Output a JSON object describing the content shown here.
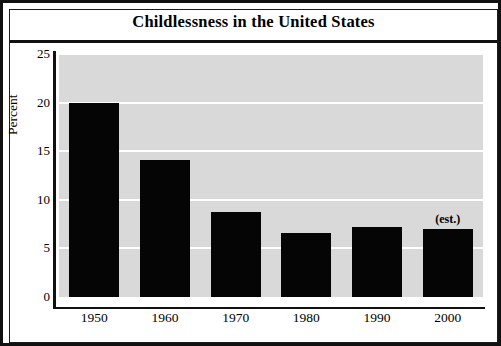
{
  "figure": {
    "title": "Childlessness in the United States"
  },
  "chart_data": {
    "type": "bar",
    "title": "Childlessness in the United States",
    "xlabel": "",
    "ylabel": "Percent",
    "categories": [
      "1950",
      "1960",
      "1970",
      "1980",
      "1990",
      "2000"
    ],
    "values": [
      20.0,
      14.1,
      8.7,
      6.6,
      7.2,
      7.0
    ],
    "ylim": [
      0,
      25
    ],
    "yticks": [
      "0",
      "5",
      "10",
      "15",
      "20",
      "25"
    ],
    "ytick_values": [
      0,
      5,
      10,
      15,
      20,
      25
    ],
    "grid": "horizontal-white-gridlines",
    "legend": "none",
    "bar_color": "#050505",
    "plot_background": "#d9d9d9",
    "annotations": [
      {
        "category": "2000",
        "text": "(est.)"
      }
    ]
  }
}
